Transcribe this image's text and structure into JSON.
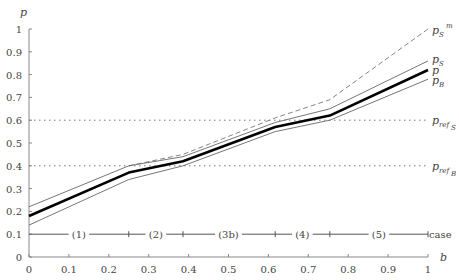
{
  "chart_data": {
    "type": "line",
    "title": "",
    "xlabel": "b",
    "ylabel": "p",
    "xlim": [
      0,
      1
    ],
    "ylim": [
      0,
      1
    ],
    "grid": false,
    "x_ticks": [
      "0",
      "0.1",
      "0.2",
      "0.3",
      "0.4",
      "0.5",
      "0.6",
      "0.7",
      "0.8",
      "0.9",
      "1"
    ],
    "y_ticks": [
      "0",
      "0.1",
      "0.2",
      "0.3",
      "0.4",
      "0.5",
      "0.6",
      "0.7",
      "0.8",
      "0.9",
      "1"
    ],
    "x": [
      0,
      0.25,
      0.386,
      0.617,
      0.754,
      1
    ],
    "series": [
      {
        "name": "p_S^m",
        "style": "dashed",
        "x": [
          0.25,
          0.386,
          0.617,
          0.754,
          1
        ],
        "values": [
          0.4,
          0.45,
          0.61,
          0.69,
          1.0
        ]
      },
      {
        "name": "p_S",
        "style": "thin",
        "values": [
          0.22,
          0.4,
          0.44,
          0.59,
          0.65,
          0.86
        ]
      },
      {
        "name": "p",
        "style": "thick",
        "values": [
          0.18,
          0.37,
          0.42,
          0.57,
          0.62,
          0.82
        ]
      },
      {
        "name": "p_B",
        "style": "thin",
        "values": [
          0.14,
          0.34,
          0.4,
          0.55,
          0.6,
          0.78
        ]
      }
    ],
    "reference_lines": [
      {
        "name": "p_ref_S",
        "y": 0.6,
        "style": "dotted"
      },
      {
        "name": "p_ref_B",
        "y": 0.4,
        "style": "dotted"
      }
    ],
    "case_line": {
      "y": 0.1,
      "label": "case",
      "boundaries": [
        0.25,
        0.386,
        0.617,
        0.754
      ],
      "segments": [
        {
          "label": "(1)",
          "x": 0.125
        },
        {
          "label": "(2)",
          "x": 0.318
        },
        {
          "label": "(3b)",
          "x": 0.5
        },
        {
          "label": "(4)",
          "x": 0.685
        },
        {
          "label": "(5)",
          "x": 0.877
        }
      ]
    }
  },
  "labels": {
    "y_axis": "p",
    "x_axis": "b",
    "case": "case",
    "p_sm": "p",
    "p_sm_sub": "S",
    "p_sm_sup": "m",
    "p_s": "p",
    "p_s_sub": "S",
    "p_main": "p",
    "p_b": "p",
    "p_b_sub": "B",
    "pref_s": "p",
    "pref_s_sub": "ref",
    "pref_s_sub2": "S",
    "pref_b": "p",
    "pref_b_sub": "ref",
    "pref_b_sub2": "B"
  }
}
